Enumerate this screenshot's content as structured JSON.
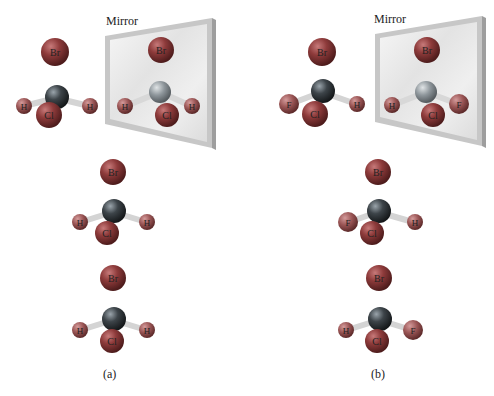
{
  "figure": {
    "panels": [
      {
        "label": "(a)",
        "mirror_label": "Mirror",
        "molecules": [
          {
            "role": "original",
            "substituents": {
              "top": "Br",
              "left": "H",
              "right": "H",
              "front": "Cl"
            }
          },
          {
            "role": "mirror-image",
            "substituents": {
              "top": "Br",
              "left": "H",
              "right": "H",
              "front": "Cl"
            }
          },
          {
            "role": "rotated-1",
            "substituents": {
              "top": "Br",
              "left": "H",
              "right": "H",
              "front": "Cl"
            }
          },
          {
            "role": "rotated-2",
            "substituents": {
              "top": "Br",
              "left": "H",
              "right": "H",
              "front": "Cl"
            }
          }
        ]
      },
      {
        "label": "(b)",
        "mirror_label": "Mirror",
        "molecules": [
          {
            "role": "original",
            "substituents": {
              "top": "Br",
              "left": "F",
              "right": "H",
              "front": "Cl"
            }
          },
          {
            "role": "mirror-image",
            "substituents": {
              "top": "Br",
              "left": "H",
              "right": "F",
              "front": "Cl"
            }
          },
          {
            "role": "rotated-1",
            "substituents": {
              "top": "Br",
              "left": "F",
              "right": "H",
              "front": "Cl"
            }
          },
          {
            "role": "rotated-2",
            "substituents": {
              "top": "Br",
              "left": "H",
              "right": "F",
              "front": "Cl"
            }
          }
        ]
      }
    ],
    "colors": {
      "halogen": "#8a3a3a",
      "hydrogen": "#9a5a5a",
      "carbon": "#3a3f44",
      "bond": "#d8d8d8",
      "mirror_frame": "#bdbdbd",
      "mirror_glass": "#ececec"
    }
  }
}
